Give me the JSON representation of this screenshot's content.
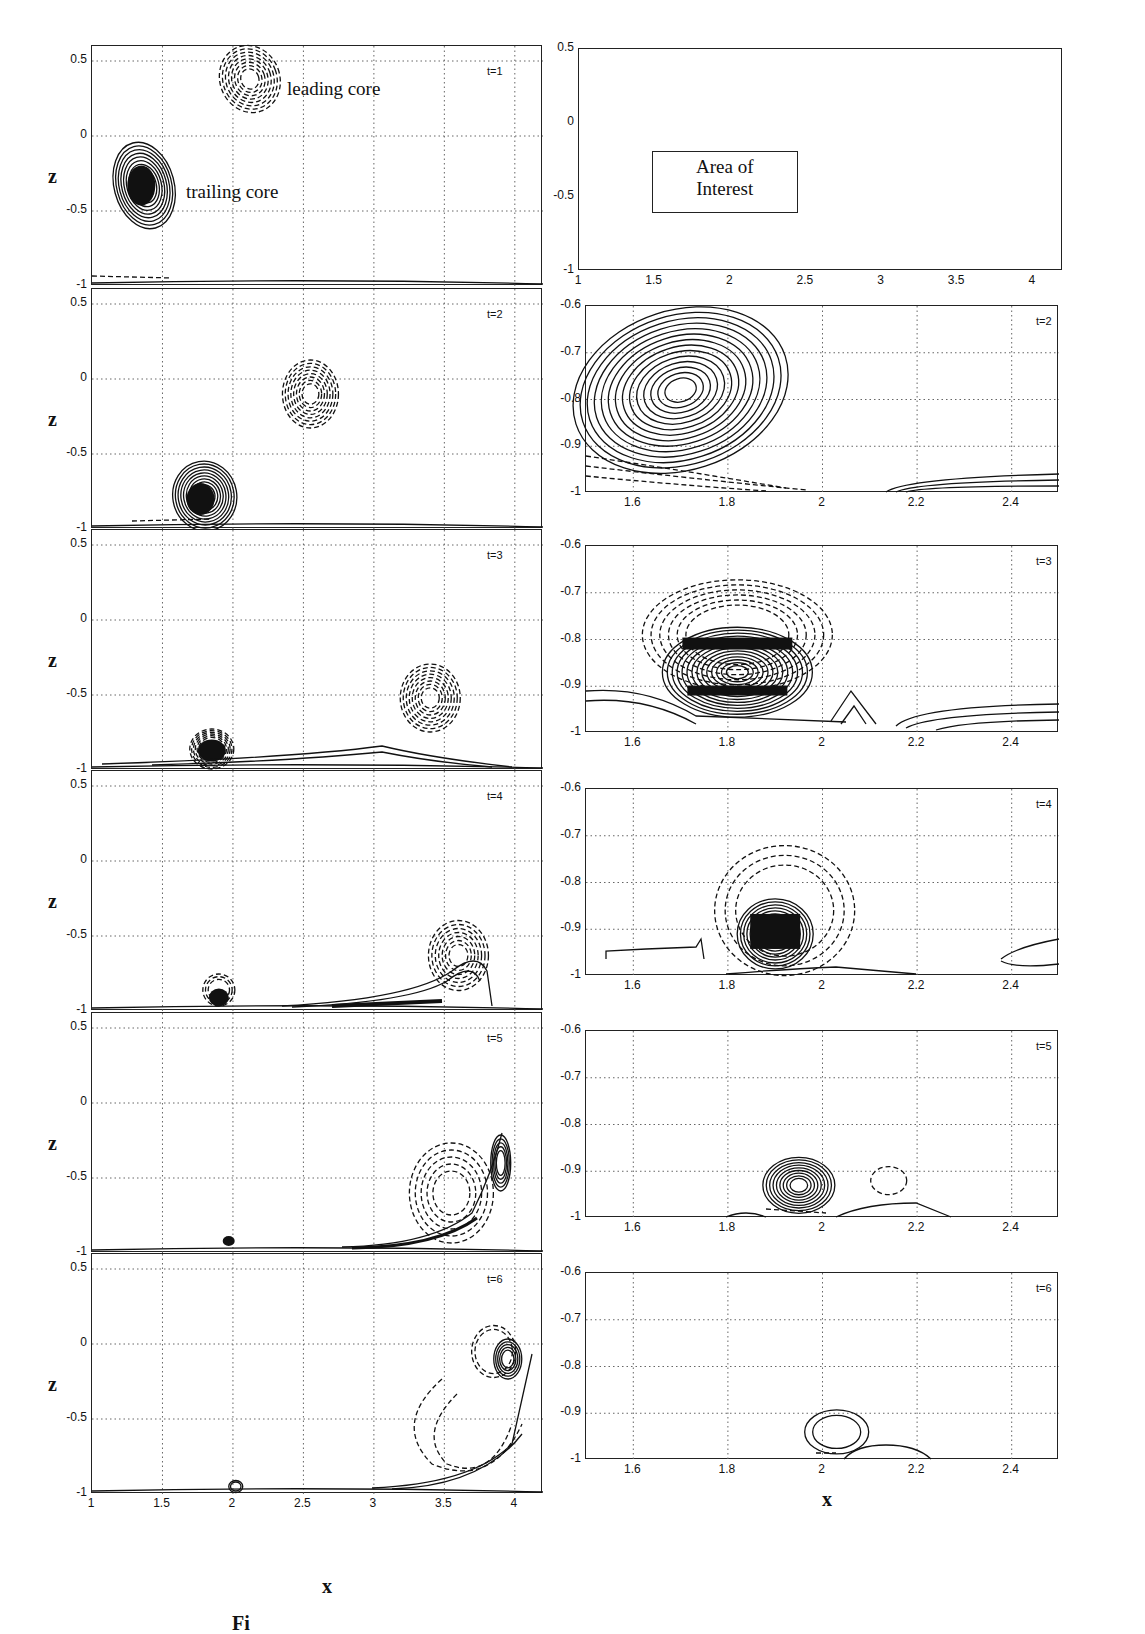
{
  "figure": {
    "caption_fragment": "Fi",
    "left_column": {
      "xlabel": "x",
      "ylabel": "z",
      "x_ticks": [
        "1",
        "1.5",
        "2",
        "2.5",
        "3",
        "3.5",
        "4"
      ],
      "y_ticks": [
        "0.5",
        "0",
        "-0.5",
        "-1"
      ],
      "annotations": {
        "leading": "leading core",
        "trailing": "trailing core"
      }
    },
    "right_column": {
      "xlabel": "x",
      "overview_x_ticks": [
        "1",
        "1.5",
        "2",
        "2.5",
        "3",
        "3.5",
        "4"
      ],
      "overview_y_ticks": [
        "0.5",
        "0",
        "-0.5",
        "-1"
      ],
      "area_of_interest_label": "Area of Interest",
      "area_of_interest_line1": "Area of",
      "area_of_interest_line2": "Interest",
      "zoom_x_ticks": [
        "1.6",
        "1.8",
        "2",
        "2.2",
        "2.4"
      ],
      "zoom_y_ticks": [
        "-0.6",
        "-0.7",
        "-0.8",
        "-0.9",
        "-1"
      ]
    }
  },
  "chart_data": [
    {
      "type": "contour",
      "panel": "left-t1",
      "title": "t=1",
      "xlabel": "",
      "ylabel": "z",
      "xlim": [
        1,
        4.2
      ],
      "ylim": [
        -1,
        0.6
      ],
      "x_ticks": [
        1,
        1.5,
        2,
        2.5,
        3,
        3.5,
        4
      ],
      "y_ticks": [
        0.5,
        0,
        -0.5,
        -1
      ],
      "grid": true,
      "features": [
        {
          "name": "leading core",
          "x": 2.1,
          "z": 0.38,
          "style": "dashed"
        },
        {
          "name": "trailing core",
          "x": 1.35,
          "z": -0.33,
          "style": "solid"
        }
      ]
    },
    {
      "type": "contour",
      "panel": "left-t2",
      "title": "t=2",
      "ylabel": "z",
      "xlim": [
        1,
        4.2
      ],
      "ylim": [
        -1,
        0.6
      ],
      "grid": true,
      "features": [
        {
          "name": "leading core",
          "x": 2.55,
          "z": -0.1,
          "style": "dashed"
        },
        {
          "name": "trailing core",
          "x": 1.75,
          "z": -0.78,
          "style": "solid"
        }
      ]
    },
    {
      "type": "contour",
      "panel": "left-t3",
      "title": "t=3",
      "ylabel": "z",
      "xlim": [
        1,
        4.2
      ],
      "ylim": [
        -1,
        0.6
      ],
      "grid": true,
      "features": [
        {
          "name": "leading core",
          "x": 3.4,
          "z": -0.52,
          "style": "dashed"
        },
        {
          "name": "trailing core",
          "x": 1.85,
          "z": -0.87,
          "style": "solid"
        }
      ]
    },
    {
      "type": "contour",
      "panel": "left-t4",
      "title": "t=4",
      "ylabel": "z",
      "xlim": [
        1,
        4.2
      ],
      "ylim": [
        -1,
        0.6
      ],
      "grid": true,
      "features": [
        {
          "name": "leading core",
          "x": 3.6,
          "z": -0.65,
          "style": "dashed"
        },
        {
          "name": "trailing core",
          "x": 1.9,
          "z": -0.9,
          "style": "solid"
        },
        {
          "name": "wall layer",
          "x": 3.5,
          "z": -0.9,
          "style": "solid"
        }
      ]
    },
    {
      "type": "contour",
      "panel": "left-t5",
      "title": "t=5",
      "ylabel": "z",
      "xlim": [
        1,
        4.2
      ],
      "ylim": [
        -1,
        0.6
      ],
      "grid": true,
      "features": [
        {
          "name": "leading core",
          "x": 3.55,
          "z": -0.6,
          "style": "dashed"
        },
        {
          "name": "secondary vortex",
          "x": 3.9,
          "z": -0.4,
          "style": "solid"
        },
        {
          "name": "trailing core",
          "x": 1.95,
          "z": -0.93,
          "style": "solid"
        }
      ]
    },
    {
      "type": "contour",
      "panel": "left-t6",
      "title": "t=6",
      "xlabel": "x",
      "ylabel": "z",
      "xlim": [
        1,
        4.2
      ],
      "ylim": [
        -1,
        0.6
      ],
      "grid": true,
      "features": [
        {
          "name": "secondary vortex",
          "x": 3.95,
          "z": -0.1,
          "style": "solid"
        },
        {
          "name": "leading core",
          "x": 3.6,
          "z": -0.7,
          "style": "dashed"
        },
        {
          "name": "trailing core",
          "x": 2.02,
          "z": -0.95,
          "style": "solid"
        }
      ]
    },
    {
      "type": "overview",
      "panel": "right-overview",
      "xlim": [
        1,
        4.2
      ],
      "ylim": [
        -1,
        0.5
      ],
      "x_ticks": [
        1,
        1.5,
        2,
        2.5,
        3,
        3.5,
        4
      ],
      "y_ticks": [
        0.5,
        0,
        -0.5,
        -1
      ],
      "grid": false,
      "annotations": [
        {
          "text": "Area of Interest",
          "x_range": [
            1.5,
            2.5
          ],
          "z_range": [
            -1,
            -0.6
          ]
        }
      ]
    },
    {
      "type": "contour",
      "panel": "right-t2",
      "title": "t=2",
      "xlim": [
        1.5,
        2.5
      ],
      "ylim": [
        -1,
        -0.6
      ],
      "x_ticks": [
        1.6,
        1.8,
        2,
        2.2,
        2.4
      ],
      "y_ticks": [
        -0.6,
        -0.7,
        -0.8,
        -0.9,
        -1
      ],
      "grid": true,
      "features": [
        {
          "name": "trailing core",
          "x": 1.7,
          "z": -0.78,
          "style": "solid"
        }
      ]
    },
    {
      "type": "contour",
      "panel": "right-t3",
      "title": "t=3",
      "xlim": [
        1.5,
        2.5
      ],
      "ylim": [
        -1,
        -0.6
      ],
      "grid": true,
      "features": [
        {
          "name": "trailing core",
          "x": 1.83,
          "z": -0.87,
          "style": "solid"
        },
        {
          "name": "induced vorticity",
          "x": 1.8,
          "z": -0.8,
          "style": "dashed"
        }
      ]
    },
    {
      "type": "contour",
      "panel": "right-t4",
      "title": "t=4",
      "xlim": [
        1.5,
        2.5
      ],
      "ylim": [
        -1,
        -0.6
      ],
      "grid": true,
      "features": [
        {
          "name": "trailing core",
          "x": 1.9,
          "z": -0.9,
          "style": "solid"
        },
        {
          "name": "induced vorticity",
          "x": 1.93,
          "z": -0.83,
          "style": "dashed"
        }
      ]
    },
    {
      "type": "contour",
      "panel": "right-t5",
      "title": "t=5",
      "xlim": [
        1.5,
        2.5
      ],
      "ylim": [
        -1,
        -0.6
      ],
      "grid": true,
      "features": [
        {
          "name": "trailing core",
          "x": 1.95,
          "z": -0.93,
          "style": "solid"
        },
        {
          "name": "small negative region",
          "x": 2.14,
          "z": -0.92,
          "style": "dashed"
        }
      ]
    },
    {
      "type": "contour",
      "panel": "right-t6",
      "title": "t=6",
      "xlabel": "x",
      "xlim": [
        1.5,
        2.5
      ],
      "ylim": [
        -1,
        -0.6
      ],
      "grid": true,
      "features": [
        {
          "name": "trailing core",
          "x": 2.03,
          "z": -0.94,
          "style": "solid"
        }
      ]
    }
  ],
  "panels": {
    "left": [
      {
        "t": "t=1"
      },
      {
        "t": "t=2"
      },
      {
        "t": "t=3"
      },
      {
        "t": "t=4"
      },
      {
        "t": "t=5"
      },
      {
        "t": "t=6"
      }
    ],
    "right": [
      {
        "t": ""
      },
      {
        "t": "t=2"
      },
      {
        "t": "t=3"
      },
      {
        "t": "t=4"
      },
      {
        "t": "t=5"
      },
      {
        "t": "t=6"
      }
    ]
  }
}
